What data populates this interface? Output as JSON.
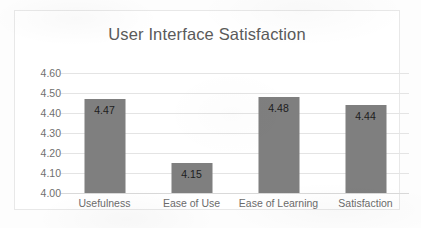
{
  "chart_data": {
    "type": "bar",
    "title": "User Interface Satisfaction",
    "xlabel": "",
    "ylabel": "",
    "categories": [
      "Usefulness",
      "Ease of Use",
      "Ease of Learning",
      "Satisfaction"
    ],
    "values": [
      4.47,
      4.15,
      4.48,
      4.44
    ],
    "value_labels": [
      "4.47",
      "4.15",
      "4.48",
      "4.44"
    ],
    "ylim": [
      4.0,
      4.6
    ],
    "ytick_step": 0.1,
    "ytick_labels": [
      "4.60",
      "4.50",
      "4.40",
      "4.30",
      "4.20",
      "4.10",
      "4.00"
    ],
    "grid": "horizontal",
    "legend": "none",
    "bar_color": "#7f7f7f",
    "title_color": "#5a5a5a",
    "tick_color": "#6f6f6f",
    "gridline_color": "#e4e4e4",
    "plot_background": "#ffffff",
    "border_color": "#e8e8e8"
  }
}
